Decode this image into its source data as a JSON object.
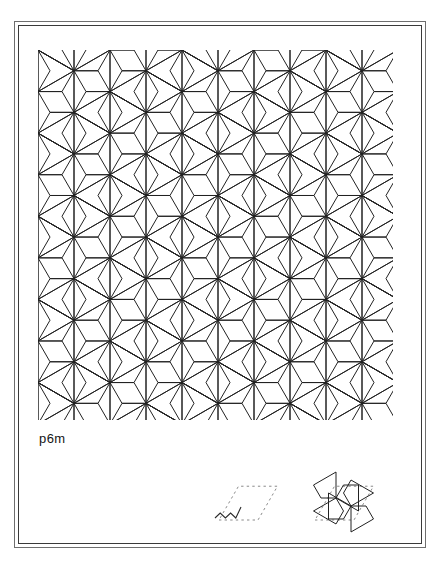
{
  "plate": {
    "width": 440,
    "height": 571,
    "background_color": "#ffffff",
    "frame": {
      "outer_color": "#6e6e6e",
      "inner_color": "#3a3a3a",
      "style": "double-rule-rectangle"
    }
  },
  "caption": {
    "label": "p6m",
    "meaning": "wallpaper group p6m"
  },
  "pattern": {
    "name": "tripod-hexiamond-tiling",
    "description": "Interlocking Y-shaped (tripod / three-rhombus) tiles forming a six-fold rosette tiling",
    "stroke_color": "#222222",
    "stroke_width": 1,
    "fill": "none",
    "tile_shape": "Y-tripod of three 60-degree rhombi",
    "lattice": "hexagonal",
    "cell_width_px": 72,
    "cell_height_px": 41.57,
    "columns": 7,
    "rows": 14,
    "region": {
      "x": 22,
      "y": 29,
      "width": 396,
      "height": 511
    },
    "tiling_bounds": {
      "left": 38,
      "top": 50,
      "right": 393,
      "bottom": 420
    }
  },
  "legend": {
    "items": [
      {
        "name": "unit-cell-rhombus",
        "label": "",
        "style": "dashed rhombus outline with zigzag generator motif",
        "dash_color": "#8a8a8a",
        "motif_color": "#2a2a2a"
      },
      {
        "name": "unit-cell-with-tiles",
        "label": "",
        "style": "dashed rhombus outline containing two interlocking tripod tiles",
        "dash_color": "#8a8a8a",
        "tile_color": "#222222"
      }
    ]
  },
  "chart_data": {
    "type": "diagram",
    "title": "p6m",
    "categories": [
      "unit cell",
      "tile motif"
    ],
    "values": [
      1,
      2
    ]
  }
}
